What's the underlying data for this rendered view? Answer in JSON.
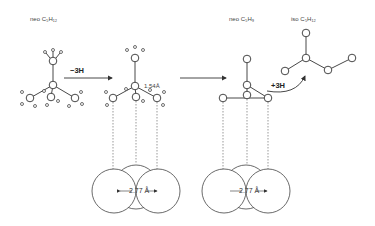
{
  "diagram": {
    "labels": {
      "left_molecule": "neo C₅H₁₂",
      "middle_molecule": "neo C₅H₉",
      "right_molecule": "iso C₅H₁₂"
    },
    "reactions": {
      "dehydrogenation": "−3H",
      "hydrogenation": "+3H"
    },
    "annotations": {
      "bond_length": "1.54Å",
      "surface_spacing_left": "← 2.77 Å →",
      "surface_spacing_right": "← 2.77 Å →"
    },
    "colors": {
      "line": "#333333",
      "background": "#ffffff"
    }
  }
}
